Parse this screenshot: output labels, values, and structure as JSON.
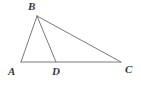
{
  "figure": {
    "kind": "geometry-diagram",
    "background_color": "#ffffff",
    "stroke_color": "#7a7a7a",
    "stroke_width": 1,
    "label_color": "#3a3a3a",
    "width": 141,
    "height": 87
  },
  "points": {
    "A": {
      "label": "A",
      "x": 21,
      "y": 62,
      "label_x": 8,
      "label_y": 66
    },
    "B": {
      "label": "B",
      "x": 37,
      "y": 16,
      "label_x": 28,
      "label_y": 1
    },
    "C": {
      "label": "C",
      "x": 121,
      "y": 62,
      "label_x": 125,
      "label_y": 64
    },
    "D": {
      "label": "D",
      "x": 56,
      "y": 62,
      "label_x": 52,
      "label_y": 66
    }
  },
  "segments": [
    {
      "name": "segment-AB",
      "from": "A",
      "to": "B"
    },
    {
      "name": "segment-BC",
      "from": "B",
      "to": "C"
    },
    {
      "name": "segment-AC",
      "from": "A",
      "to": "C"
    },
    {
      "name": "segment-BD",
      "from": "B",
      "to": "D"
    }
  ]
}
